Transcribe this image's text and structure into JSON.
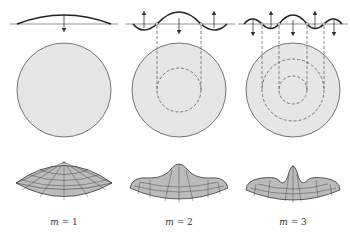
{
  "figure": {
    "panels": [
      {
        "label_var": "m",
        "label_eq": " = 1",
        "mode": 1,
        "cx": 64
      },
      {
        "label_var": "m",
        "label_eq": " = 2",
        "mode": 2,
        "cx": 179
      },
      {
        "label_var": "m",
        "label_eq": " = 3",
        "mode": 3,
        "cx": 293
      }
    ],
    "colors": {
      "disk_fill": "#e6e6e6",
      "stroke": "#444444",
      "dash": "#555555",
      "mesh": "#222222"
    }
  }
}
